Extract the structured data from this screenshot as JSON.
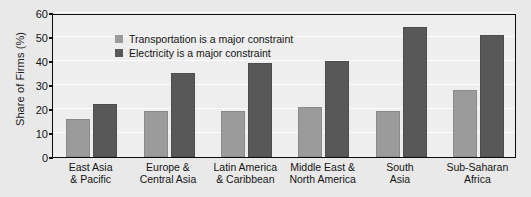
{
  "chart_data": {
    "type": "bar",
    "title": "",
    "xlabel": "",
    "ylabel": "Share of Firms (%)",
    "ylim": [
      0,
      60
    ],
    "yticks": [
      0,
      10,
      20,
      30,
      40,
      50,
      60
    ],
    "grid": true,
    "legend_position": "top-left",
    "categories": [
      "East Asia\n& Pacific",
      "Europe &\nCentral Asia",
      "Latin America\n& Caribbean",
      "Middle East &\nNorth America",
      "South\nAsia",
      "Sub-Saharan\nAfrica"
    ],
    "category_lines": [
      [
        "East Asia",
        "& Pacific"
      ],
      [
        "Europe &",
        "Central Asia"
      ],
      [
        "Latin America",
        "& Caribbean"
      ],
      [
        "Middle East &",
        "North America"
      ],
      [
        "South",
        "Asia"
      ],
      [
        "Sub-Saharan",
        "Africa"
      ]
    ],
    "series": [
      {
        "name": "Transportation is a major constraint",
        "color": "#9b9b9b",
        "values": [
          16,
          19,
          19,
          21,
          19,
          28
        ]
      },
      {
        "name": "Electricity is a major constraint",
        "color": "#585858",
        "values": [
          22,
          35,
          39,
          40,
          54,
          51
        ]
      }
    ]
  },
  "legend": {
    "items": [
      {
        "label": "Transportation is a major constraint",
        "color": "#9b9b9b"
      },
      {
        "label": "Electricity is a major constraint",
        "color": "#585858"
      }
    ]
  },
  "axis": {
    "y_title": "Share of Firms (%)",
    "y_ticks": [
      "60",
      "50",
      "40",
      "30",
      "20",
      "10",
      "0"
    ]
  },
  "colors": {
    "background": "#e9e9e9",
    "plot_background": "#eeeeee",
    "frame": "#0d0d0d",
    "gridline": "#ffffff",
    "series_light": "#9b9b9b",
    "series_dark": "#585858",
    "text": "#141414"
  }
}
